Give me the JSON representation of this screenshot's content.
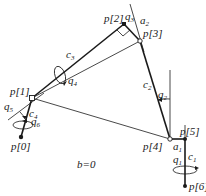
{
  "diagram": {
    "type": "kinematic-chain",
    "caption": "b=0",
    "points": [
      {
        "id": "p0",
        "label": "p[0]",
        "x": 21,
        "y": 137,
        "style": "filled"
      },
      {
        "id": "p1",
        "label": "p[1]",
        "x": 32,
        "y": 98,
        "style": "hollow"
      },
      {
        "id": "p2",
        "label": "p[2]",
        "x": 124,
        "y": 24,
        "style": "filled"
      },
      {
        "id": "p3",
        "label": "p[3]",
        "x": 140,
        "y": 41,
        "style": "hollow"
      },
      {
        "id": "p4",
        "label": "p[4]",
        "x": 170,
        "y": 139,
        "style": "hollow"
      },
      {
        "id": "p5",
        "label": "p[5]",
        "x": 185,
        "y": 139,
        "style": "filled"
      },
      {
        "id": "p6",
        "label": "p[6]",
        "x": 185,
        "y": 186,
        "style": "filled"
      }
    ],
    "labels": {
      "p0": "p[0]",
      "p1": "p[1]",
      "p2": "p[2]",
      "p3": "p[3]",
      "p4": "p[4]",
      "p5": "p[5]",
      "p6": "p[6]",
      "c1": "c",
      "c1_sub": "1",
      "c2": "c",
      "c2_sub": "2",
      "c3": "c",
      "c3_sub": "3",
      "c4": "c",
      "c4_sub": "4",
      "q1": "q",
      "q1_sub": "1",
      "q2": "q",
      "q2_sub": "2",
      "q3": "q",
      "q3_sub": "3",
      "q4": "q",
      "q4_sub": "4",
      "q5": "q",
      "q5_sub": "5",
      "q6": "q",
      "q6_sub": "6",
      "a1": "a",
      "a1_sub": "1",
      "a2": "a",
      "a2_sub": "2",
      "caption": "b=0"
    },
    "links": [
      {
        "from": "p0",
        "to": "p1",
        "name": "c4"
      },
      {
        "from": "p1",
        "to": "p2",
        "name": "c3"
      },
      {
        "from": "p2",
        "to": "p3",
        "name": "a2"
      },
      {
        "from": "p3",
        "to": "p4",
        "name": "c2"
      },
      {
        "from": "p4",
        "to": "p5",
        "name": "a1"
      },
      {
        "from": "p5",
        "to": "p6",
        "name": "c1"
      }
    ],
    "joint_angles": [
      "q1",
      "q2",
      "q3",
      "q4",
      "q5",
      "q6"
    ]
  }
}
